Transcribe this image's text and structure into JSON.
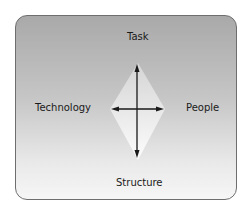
{
  "diagram": {
    "labels": {
      "top": "Task",
      "left": "Technology",
      "right": "People",
      "bottom": "Structure"
    },
    "colors": {
      "frame_border": "#6e6e6e",
      "gradient_top": "#a9a9a9",
      "gradient_bottom": "#f6f6f6",
      "diamond_fill": "#eeeeee",
      "arrow": "#1a1a1a"
    }
  }
}
